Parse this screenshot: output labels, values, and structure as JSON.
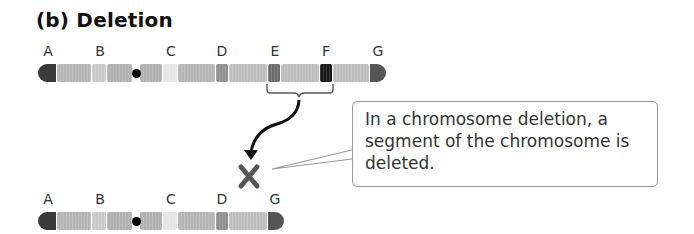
{
  "title": "(b) Deletion",
  "original_chromosome": {
    "labels": [
      {
        "text": "A",
        "x": 48
      },
      {
        "text": "B",
        "x": 100
      },
      {
        "text": "C",
        "x": 171
      },
      {
        "text": "D",
        "x": 222
      },
      {
        "text": "E",
        "x": 275
      },
      {
        "text": "F",
        "x": 326
      },
      {
        "text": "G",
        "x": 378
      }
    ],
    "segments": [
      {
        "x": 38,
        "w": 19,
        "color": "#3a3a3a",
        "kind": "cap-left"
      },
      {
        "x": 57,
        "w": 35,
        "color": "#b5b5b5",
        "kind": "band"
      },
      {
        "x": 92,
        "w": 15,
        "color": "#c8c8c8",
        "kind": "band"
      },
      {
        "x": 107,
        "w": 26,
        "color": "#b0b0b0",
        "kind": "band"
      },
      {
        "x": 140,
        "w": 23,
        "color": "#b0b0b0",
        "kind": "band"
      },
      {
        "x": 163,
        "w": 15,
        "color": "#e6e6e6",
        "kind": "band"
      },
      {
        "x": 178,
        "w": 38,
        "color": "#b5b5b5",
        "kind": "band"
      },
      {
        "x": 216,
        "w": 13,
        "color": "#8e8e8e",
        "kind": "band"
      },
      {
        "x": 229,
        "w": 39,
        "color": "#bdbdbd",
        "kind": "band"
      },
      {
        "x": 268,
        "w": 13,
        "color": "#6a6a6a",
        "kind": "band"
      },
      {
        "x": 281,
        "w": 39,
        "color": "#bdbdbd",
        "kind": "band"
      },
      {
        "x": 320,
        "w": 13,
        "color": "#151515",
        "kind": "band"
      },
      {
        "x": 333,
        "w": 37,
        "color": "#bdbdbd",
        "kind": "band"
      },
      {
        "x": 370,
        "w": 16,
        "color": "#555555",
        "kind": "cap-right"
      }
    ],
    "centromere_x": 136
  },
  "deleted_region": {
    "from_label": "E",
    "to_label": "F"
  },
  "deleted_chromosome": {
    "labels": [
      {
        "text": "A",
        "x": 48
      },
      {
        "text": "B",
        "x": 100
      },
      {
        "text": "C",
        "x": 171
      },
      {
        "text": "D",
        "x": 222
      },
      {
        "text": "G",
        "x": 275
      }
    ],
    "segments": [
      {
        "x": 38,
        "w": 19,
        "color": "#3a3a3a",
        "kind": "cap-left"
      },
      {
        "x": 57,
        "w": 35,
        "color": "#b5b5b5",
        "kind": "band"
      },
      {
        "x": 92,
        "w": 15,
        "color": "#c8c8c8",
        "kind": "band"
      },
      {
        "x": 107,
        "w": 26,
        "color": "#b0b0b0",
        "kind": "band"
      },
      {
        "x": 140,
        "w": 23,
        "color": "#b0b0b0",
        "kind": "band"
      },
      {
        "x": 163,
        "w": 15,
        "color": "#e6e6e6",
        "kind": "band"
      },
      {
        "x": 178,
        "w": 38,
        "color": "#b5b5b5",
        "kind": "band"
      },
      {
        "x": 216,
        "w": 13,
        "color": "#8e8e8e",
        "kind": "band"
      },
      {
        "x": 229,
        "w": 39,
        "color": "#bdbdbd",
        "kind": "band"
      },
      {
        "x": 268,
        "w": 16,
        "color": "#555555",
        "kind": "cap-right"
      }
    ],
    "centromere_x": 136
  },
  "deletion_mark": {
    "symbol": "✗",
    "color": "#555555"
  },
  "callout": {
    "text": "In a chromosome deletion, a segment of the chromosome is deleted."
  }
}
